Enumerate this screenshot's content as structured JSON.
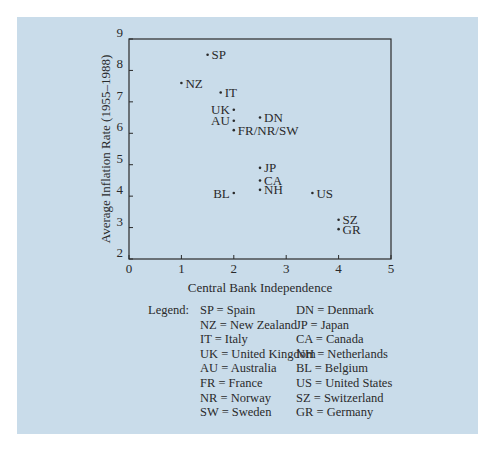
{
  "chart_data": {
    "type": "scatter",
    "title": "",
    "xlabel": "Central Bank Independence",
    "ylabel": "Average Inflation Rate (1955–1988)",
    "xlim": [
      0,
      5
    ],
    "ylim": [
      2,
      9
    ],
    "xticks": [
      0,
      1,
      2,
      3,
      4,
      5
    ],
    "yticks": [
      2,
      3,
      4,
      5,
      6,
      7,
      8,
      9
    ],
    "grid": false,
    "points": [
      {
        "label": "SP",
        "x": 1.5,
        "y": 8.5,
        "label_side": "right"
      },
      {
        "label": "NZ",
        "x": 1.0,
        "y": 7.6,
        "label_side": "right"
      },
      {
        "label": "IT",
        "x": 1.75,
        "y": 7.3,
        "label_side": "right"
      },
      {
        "label": "UK",
        "x": 2.0,
        "y": 6.75,
        "label_side": "left"
      },
      {
        "label": "AU",
        "x": 2.0,
        "y": 6.4,
        "label_side": "left"
      },
      {
        "label": "DN",
        "x": 2.5,
        "y": 6.5,
        "label_side": "right"
      },
      {
        "label": "FR/NR/SW",
        "x": 2.0,
        "y": 6.1,
        "label_side": "right"
      },
      {
        "label": "JP",
        "x": 2.5,
        "y": 4.9,
        "label_side": "right"
      },
      {
        "label": "CA",
        "x": 2.5,
        "y": 4.5,
        "label_side": "right"
      },
      {
        "label": "NH",
        "x": 2.5,
        "y": 4.2,
        "label_side": "right"
      },
      {
        "label": "BL",
        "x": 2.0,
        "y": 4.1,
        "label_side": "left"
      },
      {
        "label": "US",
        "x": 3.5,
        "y": 4.1,
        "label_side": "right"
      },
      {
        "label": "SZ",
        "x": 4.0,
        "y": 3.25,
        "label_side": "right"
      },
      {
        "label": "GR",
        "x": 4.0,
        "y": 2.95,
        "label_side": "right"
      }
    ],
    "legend_position": "below"
  },
  "legend": {
    "title": "Legend:",
    "column1": [
      "SP = Spain",
      "NZ = New Zealand",
      "IT  = Italy",
      "UK = United Kingdom",
      "AU = Australia",
      "FR = France",
      "NR = Norway",
      "SW = Sweden"
    ],
    "column2": [
      "DN = Denmark",
      "JP  = Japan",
      "CA = Canada",
      "NH = Netherlands",
      "BL = Belgium",
      "US = United States",
      "SZ = Switzerland",
      "GR = Germany"
    ]
  },
  "colors": {
    "background": "#c9dcea",
    "ink": "#2a2a2a"
  }
}
